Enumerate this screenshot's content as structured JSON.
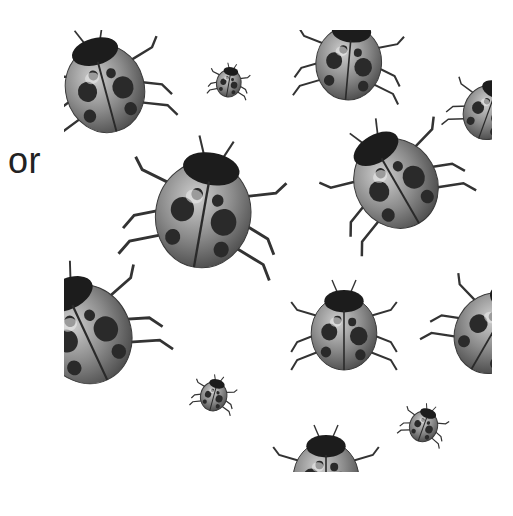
{
  "caption": {
    "text": "or"
  },
  "pattern": {
    "subject": "ladybug",
    "style": "grayscale illustration, tiled pattern",
    "colors": {
      "shell": "#8a8a8a",
      "shell_light": "#c4c4c4",
      "spots": "#2a2a2a",
      "head": "#1c1c1c",
      "legs": "#333333"
    },
    "ladybugs": [
      {
        "cx": 40,
        "cy": 55,
        "r": 48,
        "rot": -15,
        "clip": "left-top"
      },
      {
        "cx": 165,
        "cy": 52,
        "r": 15,
        "rot": 10
      },
      {
        "cx": 285,
        "cy": 30,
        "r": 40,
        "rot": 5,
        "clip": "top"
      },
      {
        "cx": 425,
        "cy": 80,
        "r": 30,
        "rot": 20,
        "clip": "right"
      },
      {
        "cx": 140,
        "cy": 180,
        "r": 58,
        "rot": 10
      },
      {
        "cx": 330,
        "cy": 150,
        "r": 50,
        "rot": -30
      },
      {
        "cx": 20,
        "cy": 300,
        "r": 55,
        "rot": -25,
        "clip": "left"
      },
      {
        "cx": 280,
        "cy": 300,
        "r": 40,
        "rot": 0
      },
      {
        "cx": 430,
        "cy": 300,
        "r": 45,
        "rot": 30,
        "clip": "right"
      },
      {
        "cx": 150,
        "cy": 365,
        "r": 16,
        "rot": 15
      },
      {
        "cx": 360,
        "cy": 395,
        "r": 17,
        "rot": 20
      },
      {
        "cx": 262,
        "cy": 445,
        "r": 40,
        "rot": 0,
        "clip": "bottom"
      }
    ]
  }
}
